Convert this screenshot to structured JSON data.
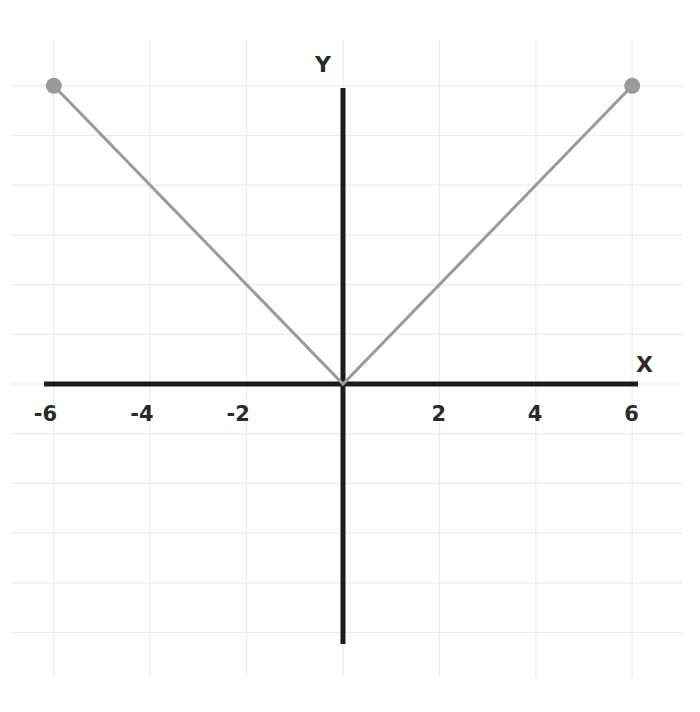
{
  "chart_data": {
    "type": "line",
    "title": "",
    "xlabel": "X",
    "ylabel": "Y",
    "x_ticks": [
      -6,
      -4,
      -2,
      2,
      4,
      6
    ],
    "x_tick_labels": [
      "-6",
      "-4",
      "-2",
      "2",
      "4",
      "6"
    ],
    "xlim": [
      -6.5,
      6.5
    ],
    "ylim": [
      -5.2,
      6
    ],
    "grid": true,
    "legend": null,
    "series": [
      {
        "name": "y = |x|",
        "x": [
          -6,
          0,
          6
        ],
        "y": [
          6,
          0,
          6
        ],
        "color": "#9a9a9a",
        "endpoint_markers": true
      }
    ]
  },
  "colors": {
    "axis": "#1c1c1c",
    "grid": "#ececec",
    "line": "#9a9a9a",
    "text": "#2a2a2a"
  }
}
